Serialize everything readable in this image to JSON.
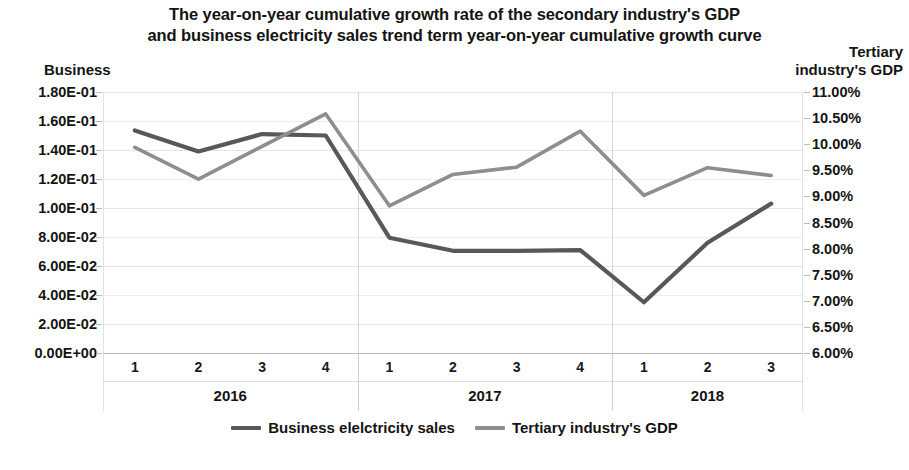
{
  "chart_data": {
    "type": "line",
    "title": "The year-on-year cumulative growth rate of the secondary industry's GDP and business electricity sales trend term year-on-year cumulative growth curve",
    "title_lines": [
      "The year-on-year cumulative growth rate of the secondary industry's GDP",
      "and business electricity sales trend term year-on-year cumulative growth curve"
    ],
    "left_axis_caption": "Business",
    "right_axis_caption_lines": [
      "Tertiary",
      "industry's GDP"
    ],
    "xlabel": "",
    "ylabel": "Business",
    "y2label": "Tertiary industry's GDP",
    "grid": true,
    "legend_position": "bottom-center",
    "x": [
      "1",
      "2",
      "3",
      "4",
      "1",
      "2",
      "3",
      "4",
      "1",
      "2",
      "3"
    ],
    "x_groups": [
      {
        "label": "2016",
        "quarters": [
          "1",
          "2",
          "3",
          "4"
        ]
      },
      {
        "label": "2017",
        "quarters": [
          "1",
          "2",
          "3",
          "4"
        ]
      },
      {
        "label": "2018",
        "quarters": [
          "1",
          "2",
          "3"
        ]
      }
    ],
    "ylim": [
      0.0,
      0.18
    ],
    "ytick_labels": [
      "1.80E-01",
      "1.60E-01",
      "1.40E-01",
      "1.20E-01",
      "1.00E-01",
      "8.00E-02",
      "6.00E-02",
      "4.00E-02",
      "2.00E-02",
      "0.00E+00"
    ],
    "ytick_values": [
      0.18,
      0.16,
      0.14,
      0.12,
      0.1,
      0.08,
      0.06,
      0.04,
      0.02,
      0.0
    ],
    "y2lim": [
      0.06,
      0.11
    ],
    "y2tick_labels": [
      "11.00%",
      "10.50%",
      "10.00%",
      "9.50%",
      "9.00%",
      "8.50%",
      "8.00%",
      "7.50%",
      "7.00%",
      "6.50%",
      "6.00%"
    ],
    "y2tick_values": [
      11.0,
      10.5,
      10.0,
      9.5,
      9.0,
      8.5,
      8.0,
      7.5,
      7.0,
      6.5,
      6.0
    ],
    "series": [
      {
        "name": "Business elelctricity sales",
        "axis": "left",
        "color": "#58585c",
        "values": [
          0.1535,
          0.139,
          0.151,
          0.15,
          0.0795,
          0.0705,
          0.0705,
          0.071,
          0.035,
          0.076,
          0.103
        ]
      },
      {
        "name": "Tertiary industry's GDP",
        "axis": "right",
        "color": "#8d8d92",
        "values": [
          9.94,
          9.33,
          9.96,
          10.58,
          8.82,
          9.42,
          9.56,
          10.25,
          9.02,
          9.55,
          9.4
        ]
      }
    ],
    "legend": [
      {
        "label": "Business elelctricity sales",
        "color": "#58585c"
      },
      {
        "label": "Tertiary industry's GDP",
        "color": "#8d8d92"
      }
    ]
  }
}
